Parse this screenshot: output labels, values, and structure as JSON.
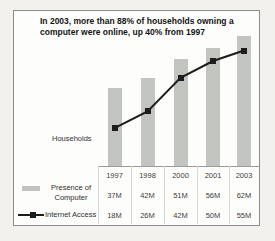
{
  "figure": {
    "title": "In 2003, more than 88% of households owning a computer were online, up 40% from 1997",
    "ylabel": "Households"
  },
  "chart_data": {
    "type": "bar",
    "note": "combo chart: gray bars + black line with square markers, shared categories, data table below",
    "categories": [
      "1997",
      "1998",
      "2000",
      "2001",
      "2003"
    ],
    "series": [
      {
        "name": "Presence of Computer",
        "type": "bar",
        "color": "#c2c4c0",
        "values": [
          37,
          42,
          51,
          56,
          62
        ],
        "labels": [
          "37M",
          "42M",
          "51M",
          "56M",
          "62M"
        ]
      },
      {
        "name": "Internet Access",
        "type": "line",
        "color": "#1d1d1d",
        "values": [
          18,
          26,
          42,
          50,
          55
        ],
        "labels": [
          "18M",
          "26M",
          "42M",
          "50M",
          "55M"
        ]
      }
    ],
    "title": "In 2003, more than 88% of households owning a computer were online, up 40% from 1997",
    "xlabel": "",
    "ylabel": "Households",
    "unit": "millions of households",
    "ylim": [
      0,
      70
    ],
    "grid": false,
    "legend_position": "bottom-left"
  }
}
